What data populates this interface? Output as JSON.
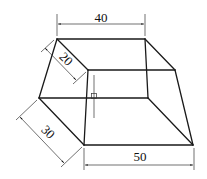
{
  "figure": {
    "type": "isometric frustum (truncated pyramid) with dimensions",
    "dimensions": {
      "top_width": "40",
      "top_depth": "20",
      "bottom_depth": "30",
      "bottom_width": "50"
    },
    "colors": {
      "line": "#1a1a1a",
      "background": "#ffffff"
    }
  }
}
